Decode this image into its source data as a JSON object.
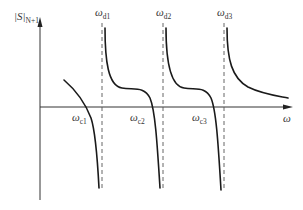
{
  "diagram": {
    "type": "function-plot-sketch",
    "colors": {
      "curve": "#1a1a1a",
      "axis": "#333333",
      "asymptote": "#555555",
      "background": "#ffffff"
    },
    "y_axis": {
      "label_main": "|S|",
      "label_sub": "N+1"
    },
    "x_axis": {
      "label": "ω"
    },
    "asymptotes": [
      {
        "label_main": "ω",
        "label_sub": "d1"
      },
      {
        "label_main": "ω",
        "label_sub": "d2"
      },
      {
        "label_main": "ω",
        "label_sub": "d3"
      }
    ],
    "zero_crossings": [
      {
        "label_main": "ω",
        "label_sub": "c1"
      },
      {
        "label_main": "ω",
        "label_sub": "c2"
      },
      {
        "label_main": "ω",
        "label_sub": "c3"
      }
    ]
  }
}
